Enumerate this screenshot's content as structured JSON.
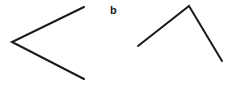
{
  "diagram": {
    "label": "b",
    "stroke_color": "#1a1a1a",
    "stroke_width": 2,
    "angles": [
      {
        "name": "left-angle",
        "points": [
          [
            84,
            7
          ],
          [
            12,
            42
          ],
          [
            84,
            79
          ]
        ]
      },
      {
        "name": "right-angle",
        "points": [
          [
            138,
            46
          ],
          [
            189,
            6
          ],
          [
            222,
            61
          ]
        ]
      }
    ]
  }
}
